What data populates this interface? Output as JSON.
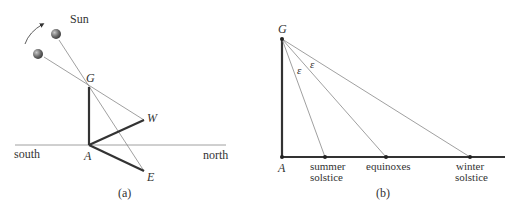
{
  "panel_a": {
    "caption": "(a)",
    "sun_label": "Sun",
    "direction_labels": {
      "south": "south",
      "north": "north"
    },
    "points": {
      "G": "G",
      "A": "A",
      "W": "W",
      "E": "E"
    },
    "colors": {
      "thick_line": "#333333",
      "thin_line": "#888888",
      "sun": "#6a6a6a"
    }
  },
  "panel_b": {
    "caption": "(b)",
    "points": {
      "G": "G",
      "A": "A"
    },
    "angle_label": "ε",
    "markers": {
      "summer_line1": "summer",
      "summer_line2": "solstice",
      "equinoxes": "equinoxes",
      "winter_line1": "winter",
      "winter_line2": "solstice"
    }
  }
}
